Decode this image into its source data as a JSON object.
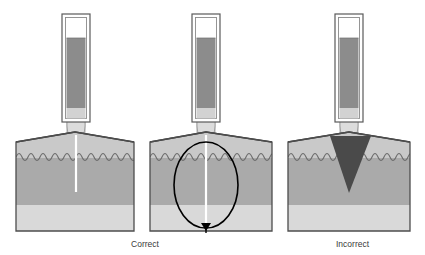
{
  "figure": {
    "title": "",
    "background_color": "#ffffff",
    "width": 425,
    "height": 255
  },
  "palette": {
    "block_outline": "#4d4d4d",
    "top_layer_fill": "#c9c9c9",
    "middle_layer_fill": "#aaaaaa",
    "bottom_layer_fill": "#d9d9d9",
    "wavy_boundary_stroke": "#6e6e6e",
    "surface_line": "#333333",
    "syringe_body_fill": "#ffffff",
    "syringe_fluid_fill": "#8c8c8c",
    "syringe_lower_fill": "#d2d2d2",
    "syringe_outline": "#5a5a5a",
    "needle_tip_fill": "#dcdcdc",
    "annotation_stroke": "#000000",
    "injection_track": "#ffffff",
    "wedge_fill": "#4a4a4a",
    "caption_color": "#3a3a3a"
  },
  "panels": [
    {
      "id": "panel-correct-left",
      "caption": "Correct",
      "caption_visible": true,
      "caption_x": 145,
      "caption_y": 247,
      "block": {
        "x": 16,
        "y": 139,
        "width": 118,
        "height": 92
      },
      "surface_peak_y": 132,
      "layers": {
        "top_band_height": 22,
        "middle_band_top": 161,
        "bottom_band_top": 205
      },
      "wavy_boundary": {
        "y": 158,
        "bumps": 10,
        "amplitude": 6
      },
      "syringe": {
        "center_x": 76,
        "barrel_x": 62,
        "barrel_y": 14,
        "barrel_width": 28,
        "barrel_height": 108,
        "fluid_top_y": 38,
        "fluid_bottom_y": 108,
        "tip_y": 108,
        "tip_height": 30,
        "tip_width": 17
      },
      "injection_track": {
        "x": 76,
        "y_top": 136,
        "y_bottom": 192,
        "width": 2
      },
      "annotation": {
        "type": "none"
      }
    },
    {
      "id": "panel-correct-middle",
      "caption": "",
      "caption_visible": false,
      "block": {
        "x": 150,
        "y": 139,
        "width": 122,
        "height": 92
      },
      "surface_peak_y": 132,
      "layers": {
        "top_band_height": 22,
        "middle_band_top": 161,
        "bottom_band_top": 205
      },
      "wavy_boundary": {
        "y": 158,
        "bumps": 10,
        "amplitude": 6
      },
      "syringe": {
        "center_x": 206,
        "barrel_x": 192,
        "barrel_y": 14,
        "barrel_width": 28,
        "barrel_height": 108,
        "fluid_top_y": 38,
        "fluid_bottom_y": 108,
        "tip_y": 108,
        "tip_height": 30,
        "tip_width": 17
      },
      "injection_track": {
        "x": 206,
        "y_top": 136,
        "y_bottom": 225,
        "width": 2
      },
      "annotation": {
        "type": "ellipse-with-arrow",
        "ellipse_cx": 206,
        "ellipse_cy": 185,
        "ellipse_rx": 32,
        "ellipse_ry": 43,
        "arrow_tip_x": 206,
        "arrow_tip_y": 231,
        "label": ""
      }
    },
    {
      "id": "panel-incorrect",
      "caption": "Incorrect",
      "caption_visible": true,
      "caption_x": 336,
      "caption_y": 247,
      "block": {
        "x": 288,
        "y": 139,
        "width": 122,
        "height": 92
      },
      "surface_peak_y": 132,
      "layers": {
        "top_band_height": 22,
        "middle_band_top": 161,
        "bottom_band_top": 205
      },
      "wavy_boundary": {
        "y": 158,
        "bumps": 10,
        "amplitude": 6
      },
      "syringe": {
        "center_x": 349,
        "barrel_x": 335,
        "barrel_y": 14,
        "barrel_width": 28,
        "barrel_height": 108,
        "fluid_top_y": 38,
        "fluid_bottom_y": 108,
        "tip_y": 108,
        "tip_height": 30,
        "tip_width": 17
      },
      "injection_track": {
        "x": 349,
        "y_top": 0,
        "y_bottom": 0,
        "width": 0
      },
      "annotation": {
        "type": "dark-wedge",
        "apex_x": 349,
        "apex_y": 193,
        "top_left_x": 330,
        "top_right_x": 371,
        "top_y": 135,
        "label": ""
      }
    }
  ],
  "captions": {
    "correct": "Correct",
    "incorrect": "Incorrect"
  }
}
